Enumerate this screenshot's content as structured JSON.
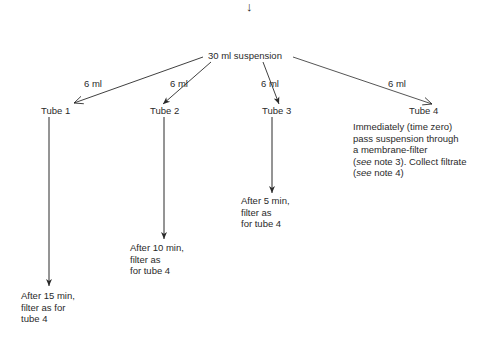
{
  "top_arrow": "↓",
  "root": {
    "label": "30 ml suspension"
  },
  "branches": [
    {
      "volume": "6 ml",
      "tube": "Tube 1",
      "instruction": [
        "After 15 min,",
        "filter as for",
        "tube 4"
      ]
    },
    {
      "volume": "6 ml",
      "tube": "Tube 2",
      "instruction": [
        "After 10 min,",
        "filter as",
        "for tube 4"
      ]
    },
    {
      "volume": "6 ml",
      "tube": "Tube 3",
      "instruction": [
        "After 5 min,",
        "filter as",
        "for tube 4"
      ]
    },
    {
      "volume": "6 ml",
      "tube": "Tube 4",
      "instruction": [
        "Immediately (time zero)",
        "pass suspension through",
        "a membrane-filter",
        "(see note 3). Collect filtrate",
        "(see note 4)"
      ]
    }
  ],
  "notes_italic_word": "see",
  "colors": {
    "ink": "#2a2a2a",
    "background": "#ffffff"
  }
}
